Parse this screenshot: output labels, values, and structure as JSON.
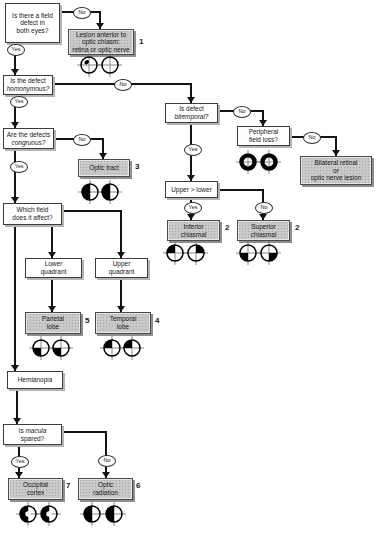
{
  "answers": {
    "yes": "Yes",
    "no": "No"
  },
  "q": {
    "both_eyes": {
      "l1": "Is there a field",
      "l2": "defect in",
      "l3": "both eyes?"
    },
    "homonymous": {
      "l1": "Is the defect",
      "l2": "homonymous?"
    },
    "congruous": {
      "l1": "Are the defects",
      "l2": "congruous?"
    },
    "which_field": {
      "l1": "Which field",
      "l2": "does it affect?"
    },
    "lower_quadrant": {
      "l1": "Lower",
      "l2": "quadrant"
    },
    "upper_quadrant": {
      "l1": "Upper",
      "l2": "quadrant"
    },
    "hemianopia": {
      "l1": "Hemianopia"
    },
    "macula": {
      "pre": "Is ",
      "it": "macula",
      "l2": "spared?"
    },
    "bitemporal": {
      "l1": "Is defect",
      "l2": "bitemporal?"
    },
    "peripheral": {
      "l1": "Peripheral",
      "l2": "field loss?"
    },
    "upper_lower": {
      "l1": "Upper > lower"
    }
  },
  "d": {
    "anterior_chiasm": {
      "l1": "Lesion anterior to",
      "l2": "optic chiasm:",
      "l3": "retina or optic nerve",
      "num": "1"
    },
    "optic_tract": {
      "l1": "Optic tract",
      "num": "3"
    },
    "inferior_chiasmal": {
      "l1": "Inferior",
      "l2": "chiasmal",
      "num": "2"
    },
    "superior_chiasmal": {
      "l1": "Superior",
      "l2": "chiasmal",
      "num": "2"
    },
    "parietal": {
      "l1": "Parietal",
      "l2": "lobe",
      "num": "5"
    },
    "temporal": {
      "l1": "Temporal",
      "l2": "lobe",
      "num": "4"
    },
    "bilateral": {
      "l1": "Bilateral retinal",
      "l2": "or",
      "l3": "optic nerve lesion"
    },
    "occipital": {
      "l1": "Occipital",
      "l2": "cortex",
      "num": "7"
    },
    "radiation": {
      "l1": "Optic",
      "l2": "radiation",
      "num": "6"
    }
  },
  "field_icons": {
    "anterior_chiasm": [
      "central-scotoma",
      "normal"
    ],
    "optic_tract": [
      "left-hemianopia",
      "left-hemianopia"
    ],
    "peripheral": [
      "peripheral-constriction",
      "peripheral-constriction"
    ],
    "inferior_chiasmal": [
      "upper-left-quadrant",
      "upper-right-quadrant"
    ],
    "superior_chiasmal": [
      "lower-left-quadrant",
      "lower-right-quadrant"
    ],
    "parietal": [
      "lower-left-quadrant",
      "lower-left-quadrant"
    ],
    "temporal": [
      "upper-left-quadrant",
      "upper-left-quadrant"
    ],
    "occipital": [
      "left-hemianopia-macular-sparing",
      "left-hemianopia-macular-sparing"
    ],
    "radiation": [
      "left-hemianopia",
      "left-hemianopia"
    ]
  },
  "colors": {
    "question_box": "#ffffff",
    "diagnosis_box": "#c9c9c9",
    "line": "#141414",
    "background": "#ffffff"
  }
}
